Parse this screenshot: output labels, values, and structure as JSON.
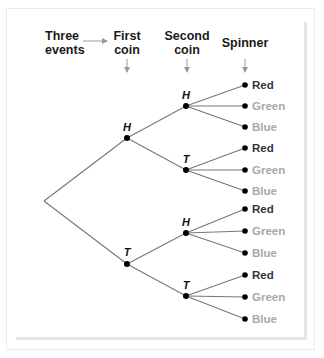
{
  "diagram": {
    "type": "tree-diagram",
    "headers": {
      "events": [
        "Three",
        "events"
      ],
      "first_coin": [
        "First",
        "coin"
      ],
      "second_coin": [
        "Second",
        "coin"
      ],
      "spinner": "Spinner"
    },
    "first_coin_nodes": [
      "H",
      "T"
    ],
    "second_coin_nodes": [
      "H",
      "T",
      "H",
      "T"
    ],
    "spinner_outcomes": [
      "Red",
      "Green",
      "Blue",
      "Red",
      "Green",
      "Blue",
      "Red",
      "Green",
      "Blue",
      "Red",
      "Green",
      "Blue"
    ],
    "colors": {
      "red_label": "#333333",
      "green_label": "#a8a8a8",
      "blue_label": "#a8a8a8",
      "lines": "#777777",
      "arrows": "#9a9a9a",
      "nodes": "#000000"
    }
  }
}
